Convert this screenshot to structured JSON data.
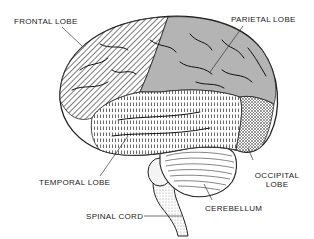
{
  "diagram": {
    "labels": {
      "frontal": "FRONTAL LOBE",
      "parietal": "PARIETAL LOBE",
      "temporal": "TEMPORAL LOBE",
      "occipital_line1": "OCCIPITAL",
      "occipital_line2": "LOBE",
      "cerebellum": "CEREBELLUM",
      "spinal_cord": "SPINAL CORD"
    },
    "regions": [
      {
        "name": "frontal lobe",
        "pattern": "diagonal-hatch"
      },
      {
        "name": "parietal lobe",
        "pattern": "solid-gray",
        "color": "#b4b4b4"
      },
      {
        "name": "temporal lobe",
        "pattern": "vertical-dashes"
      },
      {
        "name": "occipital lobe",
        "pattern": "cross-hatch"
      },
      {
        "name": "cerebellum",
        "pattern": "curved-lines"
      },
      {
        "name": "spinal cord",
        "pattern": "stipple"
      }
    ]
  }
}
